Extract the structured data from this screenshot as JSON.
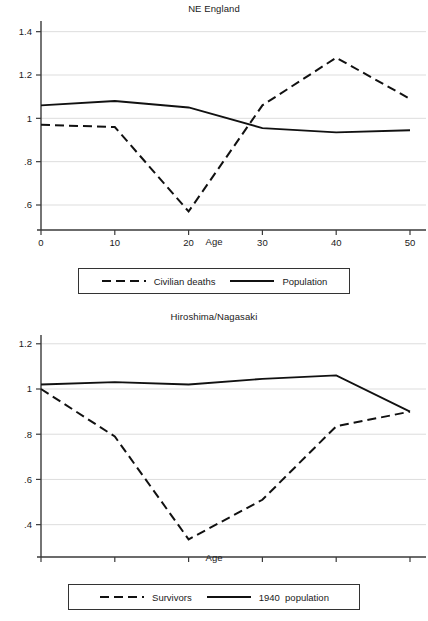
{
  "figure": {
    "axis_label": "Age",
    "line_color": "#111111"
  },
  "panels": [
    {
      "id": "ne",
      "title": "NE England",
      "legend": [
        {
          "label": "Civilian deaths",
          "style": "dashed"
        },
        {
          "label": "Population",
          "style": "solid"
        }
      ]
    },
    {
      "id": "hn",
      "title": "Hiroshima/Nagasaki",
      "legend": [
        {
          "label": "Survivors",
          "style": "dashed"
        },
        {
          "label": "1940  population",
          "style": "solid"
        }
      ]
    }
  ],
  "chart_data": [
    {
      "type": "line",
      "title": "NE England",
      "xlabel": "Age",
      "ylabel": "",
      "x": [
        0,
        10,
        20,
        30,
        40,
        50
      ],
      "xlim": [
        0,
        50
      ],
      "ylim": [
        0.54,
        1.44
      ],
      "xticks": [
        0,
        10,
        20,
        30,
        40,
        50
      ],
      "xticklabels": [
        "0",
        "10",
        "20",
        "30",
        "40",
        "50"
      ],
      "yticks": [
        0.6,
        0.8,
        1.0,
        1.2,
        1.4
      ],
      "yticklabels": [
        ".6",
        ".8",
        "1",
        "1.2",
        "1.4"
      ],
      "grid": "horizontal",
      "legend_position": "below",
      "series": [
        {
          "name": "Civilian deaths",
          "style": "dashed",
          "values": [
            0.97,
            0.96,
            0.57,
            1.06,
            1.28,
            1.09
          ]
        },
        {
          "name": "Population",
          "style": "solid",
          "values": [
            1.06,
            1.08,
            1.05,
            0.955,
            0.935,
            0.945
          ]
        }
      ]
    },
    {
      "type": "line",
      "title": "Hiroshima/Nagasaki",
      "xlabel": "Age",
      "ylabel": "",
      "x": [
        0,
        10,
        20,
        30,
        40,
        50
      ],
      "xlim": [
        0,
        50
      ],
      "ylim": [
        0.31,
        1.23
      ],
      "xticks": [
        0,
        10,
        20,
        30,
        40,
        50
      ],
      "xticklabels": [
        "0",
        "10",
        "20",
        "30",
        "40",
        "50"
      ],
      "yticks": [
        0.4,
        0.6,
        0.8,
        1.0,
        1.2
      ],
      "yticklabels": [
        ".4",
        ".6",
        ".8",
        "1",
        "1.2"
      ],
      "grid": "horizontal",
      "legend_position": "below",
      "series": [
        {
          "name": "Survivors",
          "style": "dashed",
          "values": [
            1.0,
            0.79,
            0.335,
            0.51,
            0.835,
            0.9
          ]
        },
        {
          "name": "1940  population",
          "style": "solid",
          "values": [
            1.02,
            1.03,
            1.02,
            1.045,
            1.06,
            0.9
          ]
        }
      ]
    }
  ]
}
